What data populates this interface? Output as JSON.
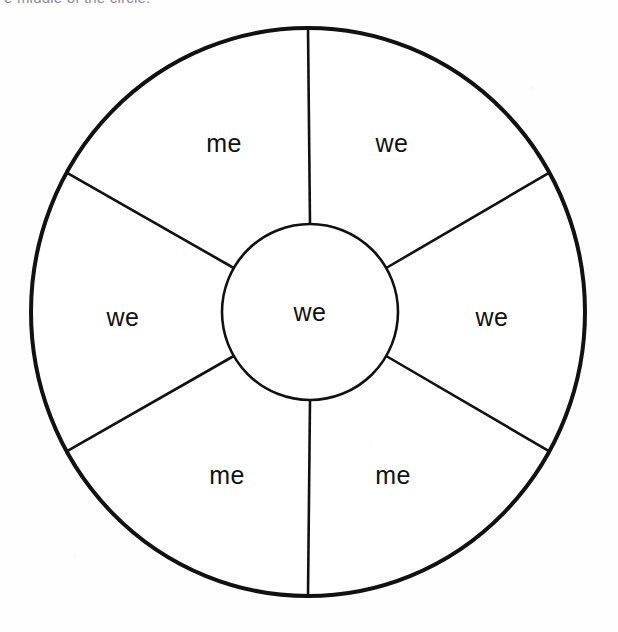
{
  "caption": {
    "text": "e middle of the circle."
  },
  "figure": {
    "name": "segmented-circle-worksheet",
    "outer_circle": {
      "cx": 308,
      "cy": 312,
      "rx": 277,
      "ry": 284,
      "stroke_width": 4,
      "stroke_color": "#111111",
      "fill_color": "#ffffff"
    },
    "inner_circle": {
      "cx": 310,
      "cy": 312,
      "r": 88,
      "stroke_width": 2.6,
      "stroke_color": "#111111",
      "fill_color": "#ffffff"
    },
    "spoke_count": 6,
    "spoke_angles_deg": [
      -90,
      -30,
      30,
      90,
      150,
      210
    ],
    "spoke_stroke_width": 2.6,
    "spoke_stroke_color": "#111111",
    "center_label": "we",
    "segments": [
      {
        "position": "top-left",
        "label": "me",
        "x": 224,
        "y": 145
      },
      {
        "position": "top-right",
        "label": "we",
        "x": 392,
        "y": 145
      },
      {
        "position": "left",
        "label": "we",
        "x": 123,
        "y": 319
      },
      {
        "position": "right",
        "label": "we",
        "x": 492,
        "y": 319
      },
      {
        "position": "bottom-left",
        "label": "me",
        "x": 227,
        "y": 477
      },
      {
        "position": "bottom-right",
        "label": "me",
        "x": 393,
        "y": 477
      }
    ]
  }
}
